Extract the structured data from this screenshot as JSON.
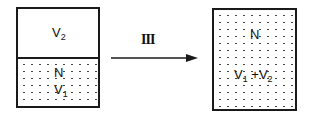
{
  "diagram": {
    "left_container": {
      "upper_region": {
        "label": "V",
        "subscript": "2",
        "filled": false
      },
      "lower_region": {
        "label_top": "N",
        "label_bottom": "V",
        "subscript": "1",
        "filled": true
      }
    },
    "process": {
      "label": "III",
      "arrow_direction": "right"
    },
    "right_container": {
      "label_top": "N",
      "label_bottom": {
        "term1": "V",
        "sub1": "1",
        "op": "+",
        "term2": "V",
        "sub2": "2"
      },
      "filled": true
    }
  }
}
